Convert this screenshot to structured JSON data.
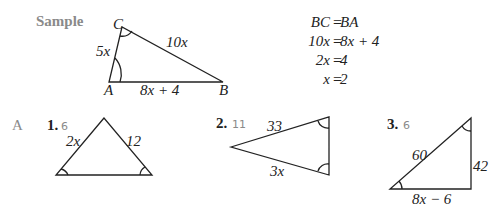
{
  "sample": {
    "label": "Sample",
    "vertices": {
      "A": "A",
      "B": "B",
      "C": "C"
    },
    "sides": {
      "AC": "5x",
      "CB": "10x",
      "AB": "8x + 4"
    },
    "equations": [
      {
        "left": "BC",
        "right": "BA"
      },
      {
        "left": "10x",
        "right": "8x + 4"
      },
      {
        "left": "2x",
        "right": "4"
      },
      {
        "left": "x",
        "right": "2"
      }
    ]
  },
  "section": "A",
  "problems": [
    {
      "number": "1.",
      "answer": "6",
      "sides": [
        "2x",
        "12"
      ]
    },
    {
      "number": "2.",
      "answer": "11",
      "sides": [
        "33",
        "3x"
      ]
    },
    {
      "number": "3.",
      "answer": "6",
      "sides": [
        "60",
        "42",
        "8x − 6"
      ]
    }
  ]
}
